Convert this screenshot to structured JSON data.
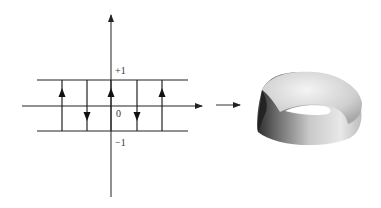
{
  "diagram": {
    "labels": {
      "top": "+1",
      "origin": "0",
      "bottom": "−1"
    },
    "arrows": [
      {
        "x": 62,
        "direction": "up"
      },
      {
        "x": 87,
        "direction": "down"
      },
      {
        "x": 111,
        "direction": "up"
      },
      {
        "x": 137,
        "direction": "down"
      },
      {
        "x": 162,
        "direction": "up"
      }
    ],
    "result": "Möbius strip",
    "colors": {
      "line": "#222222",
      "surface_light": "#f2f2f2",
      "surface_dark": "#3a3a3a"
    }
  }
}
